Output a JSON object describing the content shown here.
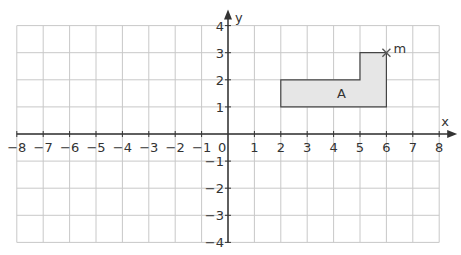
{
  "grid": {
    "x_min": -8,
    "x_max": 8,
    "y_min": -4,
    "y_max": 4,
    "origin_px": [
      228,
      134
    ],
    "unit_x_px": 26.4,
    "unit_y_px": 27.1,
    "grid_color": "#c8c8c8",
    "axis_color": "#333333"
  },
  "axes": {
    "x_label": "x",
    "y_label": "y",
    "origin_label": "0",
    "x_ticks": [
      "-8",
      "-7",
      "-6",
      "-5",
      "-4",
      "-3",
      "-2",
      "-1",
      "1",
      "2",
      "3",
      "4",
      "5",
      "6",
      "7",
      "8"
    ],
    "y_ticks": [
      "4",
      "3",
      "2",
      "1",
      "-1",
      "-2",
      "-3",
      "-4"
    ]
  },
  "shape": {
    "label": "A",
    "fill": "#e6e6e6",
    "vertices": [
      [
        2,
        1
      ],
      [
        6,
        1
      ],
      [
        6,
        3
      ],
      [
        5,
        3
      ],
      [
        5,
        2
      ],
      [
        2,
        2
      ]
    ]
  },
  "point": {
    "label": "m",
    "coords": [
      6,
      3
    ],
    "marker": "cross"
  }
}
